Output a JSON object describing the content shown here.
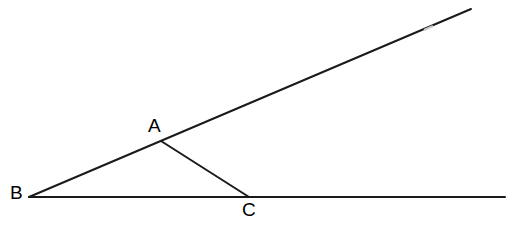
{
  "canvas": {
    "width": 511,
    "height": 226,
    "background_color": "#ffffff"
  },
  "style": {
    "line_color": "#1a1a1a",
    "line_width": 2,
    "gap_color": "#b0b0b0",
    "label_color": "#000000",
    "label_font_size": 19
  },
  "chart_data": {
    "type": "diagram",
    "title": "",
    "points": [
      {
        "name": "A",
        "x": 161,
        "y": 141,
        "label": "A",
        "label_x": 148,
        "label_y": 132
      },
      {
        "name": "B",
        "x": 29,
        "y": 197,
        "label": "B",
        "label_x": 10,
        "label_y": 199
      },
      {
        "name": "C",
        "x": 249,
        "y": 197,
        "label": "C",
        "label_x": 242,
        "label_y": 216
      }
    ],
    "segments": [
      {
        "name": "upper-ray-BD",
        "from": "B",
        "x1": 29,
        "y1": 197,
        "x2": 471,
        "y2": 9
      },
      {
        "name": "lower-ray-BE",
        "from": "B",
        "x1": 29,
        "y1": 197,
        "x2": 505,
        "y2": 197
      },
      {
        "name": "segment-AC",
        "from": "A",
        "x1": 161,
        "y1": 141,
        "x2": 249,
        "y2": 197
      }
    ],
    "line_breaks": [
      {
        "name": "upper-ray-gap",
        "x1": 424,
        "y1": 30,
        "x2": 433,
        "y2": 26
      }
    ]
  },
  "labels": {
    "a": "A",
    "b": "B",
    "c": "C"
  }
}
